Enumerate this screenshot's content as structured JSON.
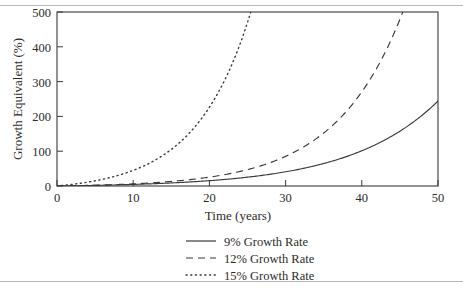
{
  "chart_data": {
    "type": "line",
    "title": "",
    "xlabel": "Time (years)",
    "ylabel": "Growth Equivalent (%)",
    "xlim": [
      0,
      50
    ],
    "ylim": [
      0,
      500
    ],
    "xticks": [
      0,
      10,
      20,
      30,
      40,
      50
    ],
    "yticks": [
      0,
      100,
      200,
      300,
      400,
      500
    ],
    "xtick_labels": [
      "0",
      "10",
      "20",
      "30",
      "40",
      "50"
    ],
    "ytick_labels": [
      "0",
      "100",
      "200",
      "300",
      "400",
      "500"
    ],
    "grid": false,
    "legend_position": "below-axes-center",
    "x": [
      0,
      5,
      10,
      15,
      20,
      25,
      30,
      35,
      40,
      45,
      50
    ],
    "series": [
      {
        "name": "9% Growth Rate",
        "style": "solid",
        "color": "#3a3a3a",
        "values": [
          0,
          44,
          78,
          111,
          141,
          168,
          190,
          209,
          224,
          236,
          244
        ]
      },
      {
        "name": "12% Growth Rate",
        "style": "dashed",
        "color": "#3a3a3a",
        "values": [
          0,
          62,
          126,
          188,
          247,
          303,
          355,
          403,
          444,
          479,
          500
        ]
      },
      {
        "name": "15% Growth Rate",
        "style": "dotted",
        "color": "#3a3a3a",
        "values": [
          0,
          100,
          197,
          290,
          378,
          470,
          500,
          500,
          500,
          500,
          500
        ]
      }
    ],
    "annotations": []
  },
  "axes": {
    "y_title": "Growth Equivalent (%)",
    "x_title": "Time (years)",
    "y_ticks": [
      {
        "label": "500"
      },
      {
        "label": "400"
      },
      {
        "label": "300"
      },
      {
        "label": "200"
      },
      {
        "label": "100"
      },
      {
        "label": "0"
      }
    ],
    "x_ticks": [
      {
        "label": "0"
      },
      {
        "label": "10"
      },
      {
        "label": "20"
      },
      {
        "label": "30"
      },
      {
        "label": "40"
      },
      {
        "label": "50"
      }
    ]
  },
  "legend": {
    "items": [
      {
        "label": "9% Growth Rate",
        "style": "solid"
      },
      {
        "label": "12% Growth Rate",
        "style": "dashed"
      },
      {
        "label": "15% Growth Rate",
        "style": "dotted"
      }
    ]
  },
  "colors": {
    "ink": "#3a3a3a",
    "text": "#2b2b2b",
    "background": "#ffffff",
    "scan_rule": "#b9b9b9"
  }
}
